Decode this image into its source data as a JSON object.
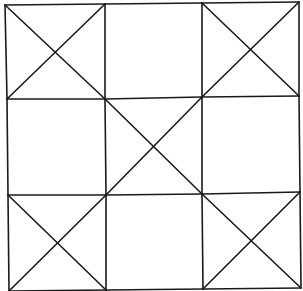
{
  "diagram": {
    "stroke_color": "#1a1a1a",
    "background": "#ffffff",
    "rows": 3,
    "cols": 3,
    "grid_points": {
      "row0": [
        [
          5,
          5
        ],
        [
          105,
          4
        ],
        [
          202,
          3
        ],
        [
          299,
          2
        ]
      ],
      "row1": [
        [
          7,
          99
        ],
        [
          105,
          99
        ],
        [
          202,
          97
        ],
        [
          299,
          96
        ]
      ],
      "row2": [
        [
          8,
          195
        ],
        [
          106,
          195
        ],
        [
          202,
          194
        ],
        [
          300,
          192
        ]
      ],
      "row3": [
        [
          9,
          291
        ],
        [
          106,
          290
        ],
        [
          203,
          289
        ],
        [
          301,
          288
        ]
      ]
    },
    "cells": [
      {
        "row": 0,
        "col": 0,
        "mark": "X"
      },
      {
        "row": 0,
        "col": 1,
        "mark": "empty"
      },
      {
        "row": 0,
        "col": 2,
        "mark": "X"
      },
      {
        "row": 1,
        "col": 0,
        "mark": "empty"
      },
      {
        "row": 1,
        "col": 1,
        "mark": "X"
      },
      {
        "row": 1,
        "col": 2,
        "mark": "empty"
      },
      {
        "row": 2,
        "col": 0,
        "mark": "X"
      },
      {
        "row": 2,
        "col": 1,
        "mark": "empty"
      },
      {
        "row": 2,
        "col": 2,
        "mark": "X"
      }
    ]
  }
}
